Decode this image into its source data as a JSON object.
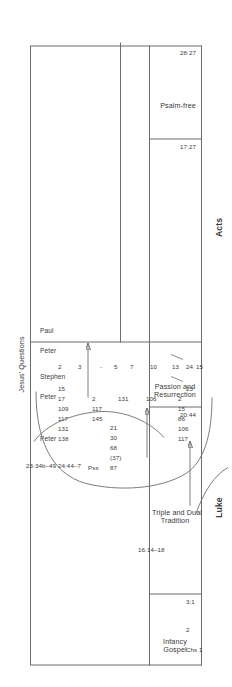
{
  "figure": {
    "books": [
      {
        "name": "Luke",
        "label": "Luke"
      },
      {
        "name": "Acts",
        "label": "Acts"
      }
    ],
    "sections": [
      {
        "id": "infancy",
        "line1": "Infancy",
        "line2": "Gospel"
      },
      {
        "id": "triple",
        "line1": "Triple and Dual",
        "line2": "Tradition"
      },
      {
        "id": "passion",
        "line1": "Passion and",
        "line2": "Resurrection"
      },
      {
        "id": "psalmfree",
        "line1": "Psalm-free",
        "line2": ""
      }
    ],
    "scale_marks": [
      {
        "id": "chs",
        "label": "Chs 1"
      },
      {
        "id": "ch2",
        "label": "2"
      },
      {
        "id": "m31",
        "label": "3:1"
      },
      {
        "id": "m2044",
        "label": "20:44"
      },
      {
        "id": "m23",
        "label": "23"
      },
      {
        "id": "m24",
        "label": "24"
      },
      {
        "id": "m1727",
        "label": "17:27"
      },
      {
        "id": "m2827",
        "label": "28:27"
      }
    ],
    "annotations": {
      "jesus_questions": "Jesus' Questions",
      "passion_ref": "23:34b–49 24:44–7",
      "acts_ref": "16:14–18"
    },
    "speaker_headers": [
      {
        "id": "luke-peter",
        "label": "Peter"
      },
      {
        "id": "acts-peter",
        "label": "Peter"
      },
      {
        "id": "acts-stephen",
        "label": "Stephen"
      },
      {
        "id": "acts-peter-2",
        "label": "Peter"
      },
      {
        "id": "acts-paul",
        "label": "Paul"
      }
    ],
    "pss_label": "Pss",
    "psalm_columns": [
      {
        "id": "luke-passion-pss",
        "header": "Pss",
        "values": [
          "87",
          "(37)",
          "68",
          "30",
          "21"
        ]
      },
      {
        "id": "acts-peter-pss",
        "header": "Peter",
        "values": [
          "138",
          "131",
          "117",
          "109",
          "17",
          "15"
        ]
      },
      {
        "id": "acts-stephen-pss",
        "header": "Stephen",
        "values": [
          "145",
          "117",
          "2"
        ]
      },
      {
        "id": "acts-peter2-pss",
        "header": "Peter",
        "values": [
          "131"
        ]
      },
      {
        "id": "acts-peter3-pss",
        "header": "",
        "values": [
          "106"
        ]
      },
      {
        "id": "acts-paul-pss",
        "header": "Paul",
        "values": [
          "117",
          "106",
          "86",
          "15",
          "2"
        ]
      }
    ],
    "chapter_ticks": [
      "2",
      "3",
      "-",
      "5",
      "7",
      "10",
      "13",
      "15"
    ],
    "colors": {
      "line": "#6d6d6d",
      "text": "#3a3a3a",
      "background": "#ffffff"
    }
  }
}
